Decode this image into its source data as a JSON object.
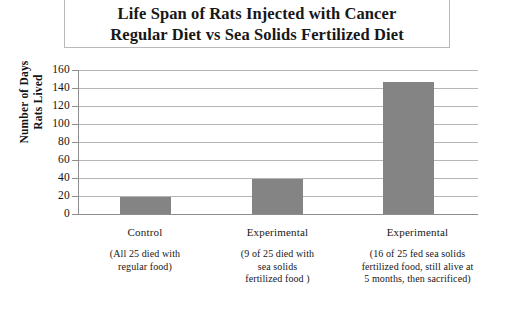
{
  "title": {
    "line1": "Life Span of Rats Injected with Cancer",
    "line2": "Regular Diet vs Sea Solids Fertilized Diet"
  },
  "axes": {
    "y_title_line1": "Number of Days",
    "y_title_line2": "Rats Lived",
    "y_ticks": [
      "160",
      "140",
      "120",
      "100",
      "80",
      "60",
      "40",
      "20",
      "0"
    ]
  },
  "categories": [
    {
      "name": "Control",
      "sub_line1": "(All 25 died with",
      "sub_line2": "regular food)",
      "sub_line3": "",
      "value": 19
    },
    {
      "name": "Experimental",
      "sub_line1": "(9 of 25 died with",
      "sub_line2": "sea solids",
      "sub_line3": "fertilized food )",
      "value": 39
    },
    {
      "name": "Experimental",
      "sub_line1": "(16 of 25 fed sea solids",
      "sub_line2": "fertilized food, still alive at",
      "sub_line3": "5 months, then sacrificed)",
      "value": 147
    }
  ],
  "colors": {
    "bar_fill": "#848484",
    "gridline": "#b5b5b5",
    "axis": "#8e8e8e",
    "text": "#171717",
    "title_border": "#b9b9b9"
  },
  "chart_data": {
    "type": "bar",
    "title": "Life Span of Rats Injected with Cancer Regular Diet vs Sea Solids Fertilized Diet",
    "xlabel": "",
    "ylabel": "Number of Days Rats Lived",
    "categories": [
      "Control",
      "Experimental",
      "Experimental"
    ],
    "category_details": [
      "Control (All 25 died with regular food)",
      "Experimental (9 of 25 died with sea solids fertilized food )",
      "Experimental (16 of 25 fed sea solids fertilized food, still alive at 5 months, then sacrificed)"
    ],
    "values": [
      19,
      39,
      147
    ],
    "ylim": [
      0,
      160
    ],
    "ytick_step": 20,
    "yticks": [
      0,
      20,
      40,
      60,
      80,
      100,
      120,
      140,
      160
    ],
    "grid": true,
    "legend": false,
    "series": [
      {
        "name": "Days Lived",
        "values": [
          19,
          39,
          147
        ]
      }
    ]
  }
}
